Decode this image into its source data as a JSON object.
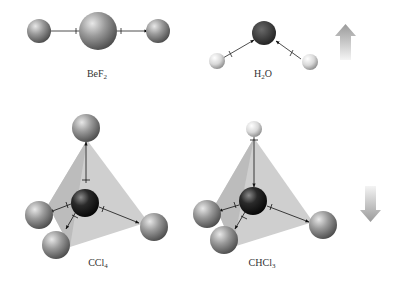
{
  "molecules": [
    {
      "id": "bef2",
      "formula_main": "BeF",
      "formula_sub": "2",
      "label_x": 97,
      "label_y": 68,
      "polarity": "nonpolar"
    },
    {
      "id": "h2o",
      "formula_pre": "H",
      "formula_sub": "2",
      "formula_post": "O",
      "label_x": 263,
      "label_y": 68,
      "polarity": "polar"
    },
    {
      "id": "ccl4",
      "formula_main": "CCl",
      "formula_sub": "4",
      "label_x": 98,
      "label_y": 257,
      "polarity": "nonpolar"
    },
    {
      "id": "chcl3",
      "formula_main": "CHCl",
      "formula_sub": "3",
      "label_x": 262,
      "label_y": 257,
      "polarity": "polar"
    }
  ],
  "arrows": [
    {
      "name": "net-dipole-up-arrow",
      "direction": "up"
    },
    {
      "name": "net-dipole-down-arrow",
      "direction": "down"
    }
  ],
  "colors": {
    "background": "#ffffff",
    "halogen_atom": "#8a8a8a",
    "central_dark_atom": "#1e1e1e",
    "hydrogen_atom": "#e6e6e6",
    "tetrahedron_face": "#c8c8c8",
    "arrow_gradient_top": "#9a9a9a",
    "arrow_gradient_bottom": "#f0f0f0"
  }
}
